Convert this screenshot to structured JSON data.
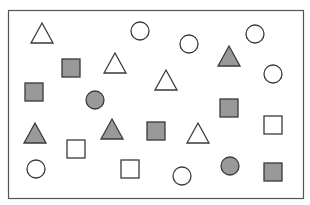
{
  "figure": {
    "width": 310,
    "height": 205,
    "frame": {
      "x": 8.5,
      "y": 10.5,
      "width": 295,
      "height": 188,
      "stroke": "#555555"
    },
    "colors": {
      "outline": "#3a3a3a",
      "gray_fill": "#999999",
      "white_fill": "#ffffff"
    },
    "shape_size": {
      "square": 18,
      "circle_r": 9,
      "triangle_w": 22,
      "triangle_h": 20
    }
  },
  "shapes": [
    {
      "type": "triangle",
      "fill": "white",
      "cx": 42,
      "cy": 33
    },
    {
      "type": "circle",
      "fill": "white",
      "cx": 140,
      "cy": 31
    },
    {
      "type": "circle",
      "fill": "white",
      "cx": 189,
      "cy": 44
    },
    {
      "type": "circle",
      "fill": "white",
      "cx": 255,
      "cy": 34
    },
    {
      "type": "square",
      "fill": "gray",
      "cx": 71,
      "cy": 68
    },
    {
      "type": "triangle",
      "fill": "white",
      "cx": 115,
      "cy": 63
    },
    {
      "type": "triangle",
      "fill": "gray",
      "cx": 229,
      "cy": 56
    },
    {
      "type": "circle",
      "fill": "white",
      "cx": 273,
      "cy": 74
    },
    {
      "type": "square",
      "fill": "gray",
      "cx": 34,
      "cy": 92
    },
    {
      "type": "circle",
      "fill": "gray",
      "cx": 95,
      "cy": 100
    },
    {
      "type": "triangle",
      "fill": "white",
      "cx": 166,
      "cy": 80
    },
    {
      "type": "square",
      "fill": "gray",
      "cx": 229,
      "cy": 108
    },
    {
      "type": "triangle",
      "fill": "gray",
      "cx": 35,
      "cy": 133
    },
    {
      "type": "triangle",
      "fill": "gray",
      "cx": 112,
      "cy": 129
    },
    {
      "type": "square",
      "fill": "gray",
      "cx": 156,
      "cy": 131
    },
    {
      "type": "triangle",
      "fill": "white",
      "cx": 198,
      "cy": 133
    },
    {
      "type": "square",
      "fill": "white",
      "cx": 273,
      "cy": 125
    },
    {
      "type": "square",
      "fill": "white",
      "cx": 76,
      "cy": 149
    },
    {
      "type": "circle",
      "fill": "white",
      "cx": 36,
      "cy": 169
    },
    {
      "type": "square",
      "fill": "white",
      "cx": 130,
      "cy": 169
    },
    {
      "type": "circle",
      "fill": "white",
      "cx": 182,
      "cy": 176
    },
    {
      "type": "circle",
      "fill": "gray",
      "cx": 230,
      "cy": 166
    },
    {
      "type": "square",
      "fill": "gray",
      "cx": 273,
      "cy": 172
    }
  ],
  "summary": {
    "total_shapes": 23,
    "triangles": 7,
    "circles": 8,
    "squares": 8,
    "gray_shapes": 11,
    "white_shapes": 12
  }
}
